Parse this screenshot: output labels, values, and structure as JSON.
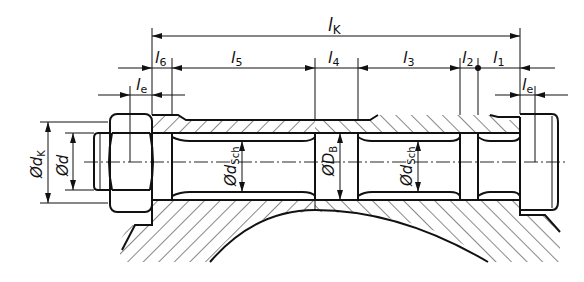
{
  "figure": {
    "colors": {
      "ink": "#111111",
      "background": "#ffffff"
    }
  },
  "dimensions": {
    "lK": {
      "symbol": "l",
      "sub": "K"
    },
    "l1": {
      "symbol": "l",
      "sub": "1"
    },
    "l2": {
      "symbol": "l",
      "sub": "2"
    },
    "l3": {
      "symbol": "l",
      "sub": "3"
    },
    "l4": {
      "symbol": "l",
      "sub": "4"
    },
    "l5": {
      "symbol": "l",
      "sub": "5"
    },
    "l6": {
      "symbol": "l",
      "sub": "6"
    },
    "le_left": {
      "symbol": "l",
      "sub": "e"
    },
    "le_right": {
      "symbol": "l",
      "sub": "e"
    }
  },
  "diameters": {
    "dK": {
      "prefix": "Ød",
      "sub": "K"
    },
    "d": {
      "prefix": "Ød",
      "sub": ""
    },
    "dSch_left": {
      "prefix": "Ød",
      "sub": "Sch"
    },
    "DB": {
      "prefix": "ØD",
      "sub": "B"
    },
    "dSch_right": {
      "prefix": "Ød",
      "sub": "Sch"
    }
  }
}
